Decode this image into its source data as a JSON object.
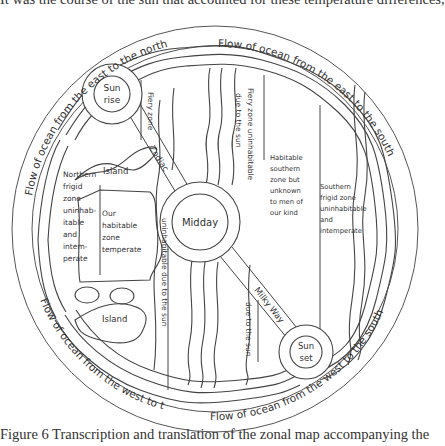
{
  "page": {
    "top_text": "It was the course of the sun that accounted for these temperature differences,",
    "caption": "Figure 6  Transcription and translation of the zonal map accompanying the"
  },
  "diagram": {
    "ocean_flows": {
      "top_right": "Flow of ocean from the east to the south",
      "top_left": "Flow of ocean from the east to the north",
      "bottom_left": "Flow of ocean from the west to the north",
      "bottom_right": "Flow of ocean from the west to the south"
    },
    "suns": {
      "sunrise_line1": "Sun",
      "sunrise_line2": "rise",
      "midday": "Midday",
      "sunset_line1": "Sun",
      "sunset_line2": "set"
    },
    "belts": {
      "zodiac": "Zodiac",
      "milky_way": "Milky Way"
    },
    "islands": {
      "upper": "Island",
      "lower": "Island"
    },
    "zones": {
      "fiery_zone": "Fiery zone",
      "fiery_zone_uninhabitable": "Fiery zone uninhabitable",
      "uninhabitable_due_to_sun_left": "uninhabitable due to the sun",
      "due_to_sun_top": "due to the sun",
      "due_to_sun_bottom": "due to the sun",
      "northern_frigid": [
        "Northern",
        "frigid",
        "zone",
        "uninhab-",
        "itable",
        "and",
        "intem-",
        "perate"
      ],
      "our_habitable": [
        "Our",
        "habitable",
        "zone",
        "temperate"
      ],
      "habitable_southern": [
        "Habitable",
        "southern",
        "zone but",
        "unknown",
        "to men of",
        "our kind"
      ],
      "southern_frigid": [
        "Southern",
        "frigid zone",
        "uninhabitable",
        "and",
        "intemperate"
      ]
    },
    "colors": {
      "line": "#4a4a4a",
      "text": "#333333",
      "background": "#ffffff"
    }
  }
}
